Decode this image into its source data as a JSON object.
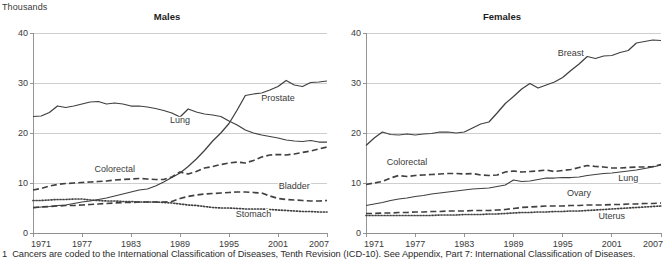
{
  "units_label": "Thousands",
  "footnote": {
    "number": "1",
    "text": "Cancers are coded to the International Classification of Diseases, Tenth Revision (ICD-10). See Appendix, Part 7: International Classification of Diseases."
  },
  "panels": [
    {
      "key": "males",
      "title": "Males"
    },
    {
      "key": "females",
      "title": "Females"
    }
  ],
  "axis": {
    "y_ticks": [
      "0",
      "10",
      "20",
      "30",
      "40"
    ],
    "x_ticks": [
      "1971",
      "1977",
      "1983",
      "1989",
      "1995",
      "2001",
      "2007"
    ]
  },
  "labels": {
    "males": {
      "lung": "Lung",
      "prostate": "Prostate",
      "colorectal": "Colorectal",
      "bladder": "Bladder",
      "stomach": "Stomach"
    },
    "females": {
      "breast": "Breast",
      "colorectal": "Colorectal",
      "lung": "Lung",
      "ovary": "Ovary",
      "uterus": "Uterus"
    }
  },
  "colors": {
    "line": "#404040",
    "grid": "#c9c9c9",
    "axis": "#8a8a8a",
    "text": "#3a3a3a"
  },
  "chart_data": [
    {
      "type": "line",
      "title": "Males",
      "xlabel": "",
      "ylabel": "Thousands",
      "xlim": [
        1971,
        2007
      ],
      "ylim": [
        0,
        40
      ],
      "grid": true,
      "legend": "inline-annotations",
      "x": [
        1971,
        1972,
        1973,
        1974,
        1975,
        1976,
        1977,
        1978,
        1979,
        1980,
        1981,
        1982,
        1983,
        1984,
        1985,
        1986,
        1987,
        1988,
        1989,
        1990,
        1991,
        1992,
        1993,
        1994,
        1995,
        1996,
        1997,
        1998,
        1999,
        2000,
        2001,
        2002,
        2003,
        2004,
        2005,
        2006,
        2007
      ],
      "series": [
        {
          "name": "Lung",
          "style": "solid",
          "values": [
            23.3,
            23.4,
            24.1,
            25.4,
            25.1,
            25.4,
            25.8,
            26.2,
            26.3,
            25.8,
            26.0,
            25.8,
            25.4,
            25.4,
            25.2,
            24.9,
            24.5,
            24.0,
            23.2,
            24.8,
            24.2,
            23.8,
            23.6,
            23.3,
            22.4,
            21.6,
            20.6,
            20.0,
            19.6,
            19.3,
            19.0,
            18.6,
            18.4,
            18.3,
            18.5,
            18.2,
            18.2
          ]
        },
        {
          "name": "Prostate",
          "style": "solid",
          "values": [
            5.0,
            5.2,
            5.3,
            5.5,
            5.6,
            5.9,
            6.2,
            6.4,
            6.7,
            7.0,
            7.4,
            7.8,
            8.2,
            8.6,
            8.8,
            9.4,
            10.2,
            11.1,
            12.0,
            13.3,
            14.8,
            16.5,
            18.4,
            20.0,
            21.9,
            24.6,
            27.5,
            27.8,
            28.0,
            28.6,
            29.3,
            30.5,
            29.6,
            29.3,
            30.1,
            30.2,
            30.4
          ]
        },
        {
          "name": "Colorectal",
          "style": "dashed",
          "values": [
            8.6,
            8.9,
            9.4,
            9.7,
            9.9,
            10.0,
            10.1,
            10.2,
            10.3,
            10.4,
            10.6,
            10.7,
            10.8,
            10.9,
            10.8,
            10.7,
            10.7,
            11.2,
            12.2,
            11.8,
            12.3,
            13.0,
            13.3,
            13.7,
            14.0,
            14.2,
            14.0,
            14.5,
            15.2,
            15.6,
            15.7,
            15.6,
            15.8,
            16.1,
            16.4,
            16.8,
            17.2
          ]
        },
        {
          "name": "Bladder",
          "style": "dashed",
          "values": [
            5.1,
            5.2,
            5.3,
            5.4,
            5.5,
            5.5,
            5.6,
            5.7,
            5.8,
            5.9,
            6.0,
            6.1,
            6.1,
            6.2,
            6.2,
            6.2,
            6.2,
            6.3,
            6.9,
            7.3,
            7.6,
            7.8,
            7.9,
            8.0,
            8.1,
            8.2,
            8.2,
            8.1,
            8.0,
            7.4,
            6.9,
            6.7,
            6.6,
            6.5,
            6.4,
            6.4,
            6.5
          ]
        },
        {
          "name": "Stomach",
          "style": "dotted",
          "values": [
            6.5,
            6.5,
            6.6,
            6.7,
            6.7,
            6.8,
            6.8,
            6.6,
            6.5,
            6.4,
            6.4,
            6.3,
            6.3,
            6.2,
            6.2,
            6.2,
            6.1,
            6.0,
            5.8,
            5.6,
            5.5,
            5.3,
            5.1,
            5.0,
            5.0,
            4.9,
            4.8,
            4.8,
            4.8,
            4.7,
            4.6,
            4.5,
            4.4,
            4.3,
            4.3,
            4.2,
            4.2
          ]
        }
      ]
    },
    {
      "type": "line",
      "title": "Females",
      "xlabel": "",
      "ylabel": "Thousands",
      "xlim": [
        1971,
        2007
      ],
      "ylim": [
        0,
        40
      ],
      "grid": true,
      "legend": "inline-annotations",
      "x": [
        1971,
        1972,
        1973,
        1974,
        1975,
        1976,
        1977,
        1978,
        1979,
        1980,
        1981,
        1982,
        1983,
        1984,
        1985,
        1986,
        1987,
        1988,
        1989,
        1990,
        1991,
        1992,
        1993,
        1994,
        1995,
        1996,
        1997,
        1998,
        1999,
        2000,
        2001,
        2002,
        2003,
        2004,
        2005,
        2006,
        2007
      ],
      "series": [
        {
          "name": "Breast",
          "style": "solid",
          "values": [
            17.5,
            19.0,
            20.2,
            19.7,
            19.6,
            19.8,
            19.6,
            19.8,
            19.9,
            20.2,
            20.2,
            20.0,
            20.2,
            21.0,
            21.8,
            22.2,
            24.0,
            25.9,
            27.3,
            28.8,
            29.9,
            29.0,
            29.6,
            30.2,
            31.1,
            32.5,
            33.8,
            35.3,
            34.9,
            35.4,
            35.5,
            36.1,
            36.5,
            38.0,
            38.3,
            38.6,
            38.5
          ]
        },
        {
          "name": "Colorectal",
          "style": "dashed",
          "values": [
            9.7,
            10.0,
            10.3,
            11.0,
            11.5,
            11.3,
            11.5,
            11.6,
            11.7,
            11.8,
            11.9,
            11.9,
            11.8,
            11.9,
            11.6,
            11.5,
            11.6,
            12.2,
            12.4,
            12.2,
            12.3,
            12.4,
            12.6,
            12.3,
            12.5,
            12.7,
            13.1,
            13.5,
            13.3,
            13.2,
            13.0,
            13.0,
            13.1,
            13.2,
            13.2,
            13.3,
            13.7
          ]
        },
        {
          "name": "Lung",
          "style": "solid",
          "values": [
            5.5,
            5.8,
            6.1,
            6.5,
            6.8,
            7.0,
            7.3,
            7.5,
            7.8,
            8.0,
            8.2,
            8.4,
            8.6,
            8.8,
            8.9,
            9.0,
            9.3,
            9.6,
            10.6,
            10.3,
            10.4,
            10.7,
            11.0,
            11.0,
            11.1,
            11.1,
            11.2,
            11.5,
            11.7,
            11.9,
            12.0,
            12.2,
            12.4,
            12.6,
            12.9,
            13.2,
            13.6
          ]
        },
        {
          "name": "Ovary",
          "style": "dashed",
          "values": [
            3.9,
            3.9,
            4.0,
            4.0,
            4.1,
            4.1,
            4.2,
            4.2,
            4.3,
            4.3,
            4.4,
            4.4,
            4.4,
            4.5,
            4.5,
            4.5,
            4.6,
            4.7,
            4.9,
            5.1,
            5.2,
            5.3,
            5.4,
            5.4,
            5.4,
            5.5,
            5.5,
            5.6,
            5.6,
            5.6,
            5.7,
            5.7,
            5.8,
            5.8,
            5.9,
            5.9,
            6.0
          ]
        },
        {
          "name": "Uterus",
          "style": "dotted",
          "values": [
            3.5,
            3.5,
            3.5,
            3.5,
            3.5,
            3.5,
            3.5,
            3.5,
            3.5,
            3.6,
            3.6,
            3.6,
            3.7,
            3.7,
            3.7,
            3.8,
            3.8,
            3.9,
            4.0,
            4.1,
            4.1,
            4.2,
            4.2,
            4.3,
            4.3,
            4.4,
            4.4,
            4.5,
            4.6,
            4.7,
            4.8,
            4.9,
            5.0,
            5.1,
            5.2,
            5.3,
            5.4
          ]
        }
      ]
    }
  ],
  "annotations": {
    "males": [
      {
        "name": "Lung",
        "x": 1989,
        "y": 22.0
      },
      {
        "name": "Prostate",
        "x": 2001,
        "y": 26.5
      },
      {
        "name": "Colorectal",
        "x": 1981,
        "y": 12.3
      },
      {
        "name": "Bladder",
        "x": 2003,
        "y": 8.8
      },
      {
        "name": "Stomach",
        "x": 1998,
        "y": 3.2
      }
    ],
    "females": [
      {
        "name": "Breast",
        "x": 1996,
        "y": 35.5
      },
      {
        "name": "Colorectal",
        "x": 1976,
        "y": 13.6
      },
      {
        "name": "Lung",
        "x": 2003,
        "y": 10.4
      },
      {
        "name": "Ovary",
        "x": 1997,
        "y": 7.5
      },
      {
        "name": "Uterus",
        "x": 2001,
        "y": 2.9
      }
    ]
  }
}
